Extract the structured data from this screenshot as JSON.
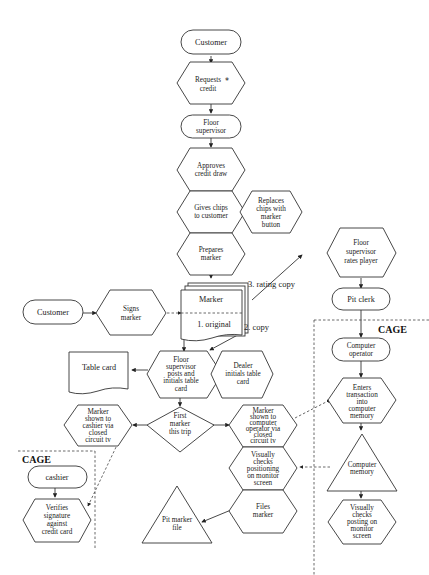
{
  "diagram": {
    "type": "flowchart",
    "nodes": {
      "customer_top": "Customer",
      "requests_credit": [
        "Requests",
        "credit"
      ],
      "requests_credit_mark": "*",
      "floor_supervisor": [
        "Floor",
        "supervisor"
      ],
      "approves_credit": [
        "Approves",
        "credit draw"
      ],
      "gives_chips": [
        "Gives chips",
        "to customer"
      ],
      "replaces_chips": [
        "Replaces",
        "chips with",
        "marker",
        "button"
      ],
      "prepares_marker": [
        "Prepares",
        "marker"
      ],
      "customer_left": "Customer",
      "signs_marker": [
        "Signs",
        "marker"
      ],
      "marker_doc": "Marker",
      "marker_original": "1. original",
      "marker_copy": "2.  copy",
      "marker_rating_copy": "3.  rating copy",
      "floor_rates_player": [
        "Floor",
        "supervisor",
        "rates player"
      ],
      "pit_clerk": "Pit clerk",
      "table_card": "Table card",
      "floor_posts_initials": [
        "Floor",
        "supervisor",
        "posts and",
        "initials table",
        "card"
      ],
      "dealer_initials": [
        "Dealer",
        "initials table",
        "card"
      ],
      "first_marker": [
        "First",
        "marker",
        "this trip"
      ],
      "shown_to_cashier": [
        "Marker",
        "shown to",
        "cashier via",
        "closed",
        "circuit tv"
      ],
      "shown_to_operator": [
        "Marker",
        "shown to",
        "computer",
        "operator via",
        "closed",
        "circuit tv"
      ],
      "visually_checks_positioning": [
        "Visually",
        "checks",
        "positioning",
        "on monitor",
        "screen"
      ],
      "files_marker": [
        "Files",
        "marker"
      ],
      "pit_marker_file": [
        "Pit marker",
        "file"
      ],
      "cashier": "cashier",
      "verifies_signature": [
        "Verifies",
        "signature",
        "against",
        "credit card"
      ],
      "computer_operator": [
        "Computer",
        "operator"
      ],
      "enters_transaction": [
        "Enters",
        "transaction",
        "into",
        "computer",
        "memory"
      ],
      "computer_memory": [
        "Computer",
        "memory"
      ],
      "visually_checks_posting": [
        "Visually",
        "checks",
        "posting on",
        "monitor",
        "screen"
      ]
    },
    "regions": {
      "cage_right": "CAGE",
      "cage_left": "CAGE"
    },
    "edges": [
      [
        "Customer",
        "Requests credit"
      ],
      [
        "Requests credit",
        "Floor supervisor"
      ],
      [
        "Floor supervisor",
        "Approves credit draw"
      ],
      [
        "Approves credit draw",
        "Gives chips to customer"
      ],
      [
        "Gives chips to customer",
        "Prepares marker"
      ],
      [
        "Prepares marker",
        "Marker"
      ],
      [
        "Customer",
        "Signs marker"
      ],
      [
        "Signs marker",
        "Marker"
      ],
      [
        "Marker (3. rating copy)",
        "Floor supervisor rates player"
      ],
      [
        "Floor supervisor rates player",
        "Pit clerk"
      ],
      [
        "Pit clerk",
        "Computer operator"
      ],
      [
        "Computer operator",
        "Enters transaction into computer memory"
      ],
      [
        "Enters transaction into computer memory",
        "Computer memory"
      ],
      [
        "Computer memory",
        "Visually checks posting on monitor screen"
      ],
      [
        "Marker (1. original)",
        "Floor supervisor posts and initials table card"
      ],
      [
        "Marker (2. copy)",
        "Floor supervisor posts and initials table card"
      ],
      [
        "Floor supervisor posts and initials table card",
        "Table card"
      ],
      [
        "Floor supervisor posts and initials table card",
        "First marker this trip"
      ],
      [
        "First marker this trip",
        "Marker shown to cashier via closed circuit tv"
      ],
      [
        "First marker this trip",
        "Marker shown to computer operator via closed circuit tv"
      ],
      [
        "Marker shown to computer operator via closed circuit tv",
        "Enters transaction into computer memory"
      ],
      [
        "Computer memory",
        "Visually checks positioning on monitor screen"
      ],
      [
        "Files marker",
        "Pit marker file"
      ],
      [
        "Marker shown to cashier via closed circuit tv",
        "Verifies signature against credit card"
      ],
      [
        "cashier",
        "Verifies signature against credit card"
      ]
    ]
  }
}
